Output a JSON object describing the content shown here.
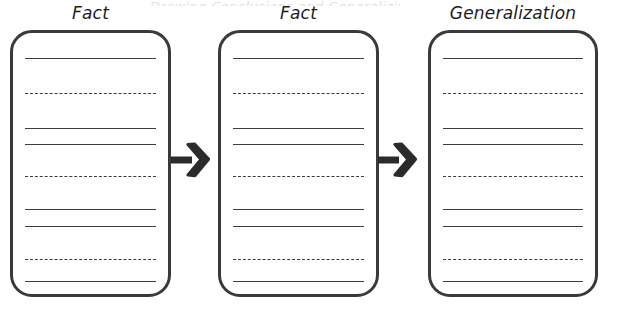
{
  "document": {
    "title": "Fact to Generalization Graphic Organizer",
    "top_clipped_text": "Drawing Conclusions and Generalizing",
    "background_color": "#ffffff",
    "ink_color": "#3a3a3a",
    "rule_color": "#3d3d3d"
  },
  "panels": [
    {
      "id": "panel-1",
      "label": "Fact",
      "icon": "rounded-rectangle-box",
      "x": 10,
      "y": 30,
      "width": 161,
      "height": 267,
      "lines": [
        {
          "index": 1,
          "style": "solid",
          "y": 25
        },
        {
          "index": 2,
          "style": "dashed",
          "y": 60
        },
        {
          "index": 3,
          "style": "solid",
          "y": 95
        },
        {
          "index": 4,
          "style": "solid",
          "y": 111
        },
        {
          "index": 5,
          "style": "dashed",
          "y": 143
        },
        {
          "index": 6,
          "style": "solid",
          "y": 176
        },
        {
          "index": 7,
          "style": "solid",
          "y": 193
        },
        {
          "index": 8,
          "style": "dashed",
          "y": 226
        },
        {
          "index": 9,
          "style": "solid",
          "y": 248
        }
      ]
    },
    {
      "id": "panel-2",
      "label": "Fact",
      "icon": "rounded-rectangle-box",
      "x": 218,
      "y": 30,
      "width": 161,
      "height": 267,
      "lines": [
        {
          "index": 1,
          "style": "solid",
          "y": 25
        },
        {
          "index": 2,
          "style": "dashed",
          "y": 60
        },
        {
          "index": 3,
          "style": "solid",
          "y": 95
        },
        {
          "index": 4,
          "style": "solid",
          "y": 111
        },
        {
          "index": 5,
          "style": "dashed",
          "y": 143
        },
        {
          "index": 6,
          "style": "solid",
          "y": 176
        },
        {
          "index": 7,
          "style": "solid",
          "y": 193
        },
        {
          "index": 8,
          "style": "dashed",
          "y": 226
        },
        {
          "index": 9,
          "style": "solid",
          "y": 248
        }
      ]
    },
    {
      "id": "panel-3",
      "label": "Generalization",
      "icon": "rounded-rectangle-box",
      "x": 428,
      "y": 30,
      "width": 170,
      "height": 267,
      "lines": [
        {
          "index": 1,
          "style": "solid",
          "y": 25
        },
        {
          "index": 2,
          "style": "dashed",
          "y": 60
        },
        {
          "index": 3,
          "style": "solid",
          "y": 95
        },
        {
          "index": 4,
          "style": "solid",
          "y": 111
        },
        {
          "index": 5,
          "style": "dashed",
          "y": 143
        },
        {
          "index": 6,
          "style": "solid",
          "y": 176
        },
        {
          "index": 7,
          "style": "solid",
          "y": 193
        },
        {
          "index": 8,
          "style": "dashed",
          "y": 226
        },
        {
          "index": 9,
          "style": "solid",
          "y": 248
        }
      ]
    }
  ],
  "arrows": [
    {
      "id": "arrow-1",
      "from": "panel-1",
      "to": "panel-2",
      "direction": "right",
      "x": 171,
      "y": 141,
      "width": 40,
      "height": 38
    },
    {
      "id": "arrow-2",
      "from": "panel-2",
      "to": "panel-3",
      "direction": "right",
      "x": 378,
      "y": 141,
      "width": 40,
      "height": 38
    }
  ]
}
